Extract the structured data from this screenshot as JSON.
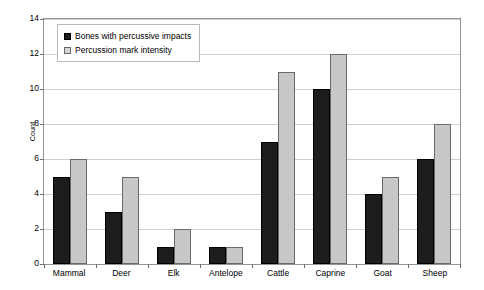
{
  "chart_data": {
    "type": "bar",
    "title": "",
    "xlabel": "",
    "ylabel": "Count",
    "ylim": [
      0,
      14
    ],
    "yticks": [
      0,
      2,
      4,
      6,
      8,
      10,
      12,
      14
    ],
    "grid": true,
    "legend_position": "top-left",
    "categories": [
      "Mammal",
      "Deer",
      "Elk",
      "Antelope",
      "Cattle",
      "Caprine",
      "Goat",
      "Sheep"
    ],
    "series": [
      {
        "name": "Bones with percussive impacts",
        "color": "#1c1c1c",
        "values": [
          5,
          3,
          1,
          1,
          7,
          10,
          4,
          6
        ]
      },
      {
        "name": "Percussion mark intensity",
        "color": "#c8c8c8",
        "values": [
          6,
          5,
          2,
          1,
          11,
          12,
          5,
          8
        ]
      }
    ]
  },
  "legend": {
    "items": [
      {
        "label": "Bones with percussive impacts",
        "swatch": "filled-black-square-icon"
      },
      {
        "label": "Percussion mark intensity",
        "swatch": "outlined-gray-square-icon"
      }
    ]
  },
  "axes": {
    "y_title": "Count",
    "y_tick_labels": [
      "14",
      "12",
      "10",
      "8",
      "6",
      "4",
      "2",
      "0"
    ],
    "x_tick_labels": [
      "Mammal",
      "Deer",
      "Elk",
      "Antelope",
      "Cattle",
      "Caprine",
      "Goat",
      "Sheep"
    ]
  }
}
